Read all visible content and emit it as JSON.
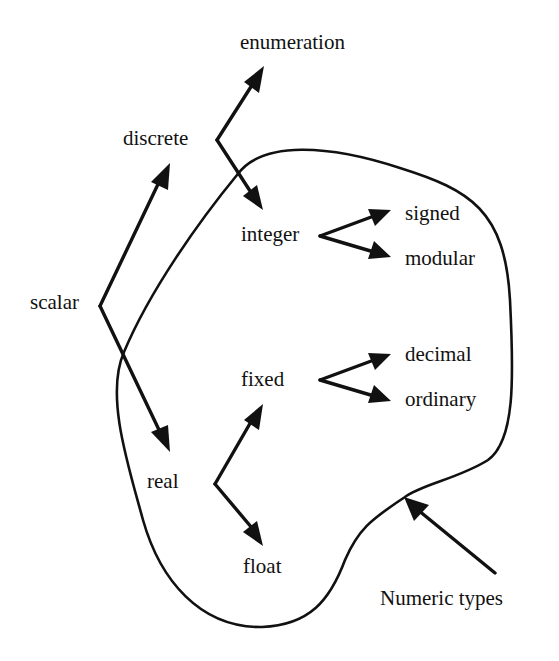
{
  "diagram": {
    "colors": {
      "ink": "#111111",
      "background": "#ffffff"
    },
    "nodes": {
      "scalar": "scalar",
      "discrete": "discrete",
      "real": "real",
      "enumeration": "enumeration",
      "integer": "integer",
      "signed": "signed",
      "modular": "modular",
      "fixed": "fixed",
      "float": "float",
      "decimal": "decimal",
      "ordinary": "ordinary"
    },
    "region": {
      "label": "Numeric types",
      "contains": [
        "integer",
        "signed",
        "modular",
        "fixed",
        "decimal",
        "ordinary",
        "float"
      ]
    },
    "edges": [
      {
        "from": "scalar",
        "to": "discrete"
      },
      {
        "from": "scalar",
        "to": "real"
      },
      {
        "from": "discrete",
        "to": "enumeration"
      },
      {
        "from": "discrete",
        "to": "integer"
      },
      {
        "from": "integer",
        "to": "signed"
      },
      {
        "from": "integer",
        "to": "modular"
      },
      {
        "from": "real",
        "to": "fixed"
      },
      {
        "from": "real",
        "to": "float"
      },
      {
        "from": "fixed",
        "to": "decimal"
      },
      {
        "from": "fixed",
        "to": "ordinary"
      }
    ]
  }
}
